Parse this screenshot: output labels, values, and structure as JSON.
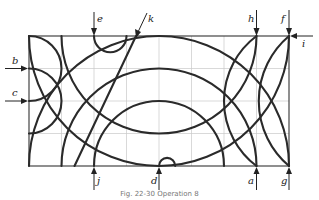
{
  "figure": {
    "caption": "Fig. 22-30  Operation 8",
    "grid": {
      "columns": 8,
      "rows": 4,
      "origin_px": [
        29,
        36
      ],
      "cell_px": 32.5
    },
    "colors": {
      "line": "#2a2a2a",
      "grid": "#c8c8c8",
      "background": "#ffffff"
    },
    "labels": {
      "a": "a",
      "b": "b",
      "c": "c",
      "d": "d",
      "e": "e",
      "f": "f",
      "g": "g",
      "h": "h",
      "i": "i",
      "j": "j",
      "k": "k"
    },
    "arrows": [
      {
        "id": "a",
        "side": "bottom",
        "grid_x": 7
      },
      {
        "id": "b",
        "side": "left",
        "grid_y": 1
      },
      {
        "id": "c",
        "side": "left",
        "grid_y": 2
      },
      {
        "id": "d",
        "side": "bottom",
        "grid_x": 4
      },
      {
        "id": "e",
        "side": "top",
        "grid_x": 2
      },
      {
        "id": "f",
        "side": "top",
        "grid_x": 8
      },
      {
        "id": "g",
        "side": "bottom",
        "grid_x": 8
      },
      {
        "id": "h",
        "side": "top",
        "grid_x": 7
      },
      {
        "id": "i",
        "side": "right",
        "grid_y": 0
      },
      {
        "id": "j",
        "side": "bottom",
        "grid_x": 2
      },
      {
        "id": "k",
        "side": "top-diagonal",
        "grid_x": 3.3
      }
    ],
    "curves": [
      {
        "name": "outer-arch",
        "type": "arc",
        "center": [
          4,
          4
        ],
        "radius": 4,
        "half": "upper"
      },
      {
        "name": "middle-arch",
        "type": "arc",
        "center": [
          4,
          4
        ],
        "radius": 3,
        "half": "upper"
      },
      {
        "name": "inner-arch",
        "type": "arc",
        "center": [
          4,
          4
        ],
        "radius": 2,
        "half": "upper"
      },
      {
        "name": "large-bowl",
        "type": "arc",
        "center": [
          4,
          0
        ],
        "radius": 4,
        "half": "lower"
      },
      {
        "name": "small-bowl",
        "type": "arc",
        "center": [
          4,
          0
        ],
        "radius": 3,
        "half": "lower"
      },
      {
        "name": "left-lobe-upper",
        "type": "arc",
        "center": [
          0,
          1
        ],
        "radius": 1,
        "half": "right"
      },
      {
        "name": "left-lobe-lower",
        "type": "arc",
        "center": [
          0,
          2
        ],
        "radius": 1,
        "half": "right"
      },
      {
        "name": "right-lens",
        "type": "arc",
        "through": [
          [
            7,
            0
          ],
          [
            6,
            2
          ],
          [
            7,
            4
          ]
        ]
      },
      {
        "name": "right-lens-outer",
        "type": "arc",
        "through": [
          [
            8,
            0
          ],
          [
            6.8,
            2
          ],
          [
            8,
            4
          ]
        ]
      },
      {
        "name": "e-notch",
        "type": "arc",
        "center": [
          2.5,
          0
        ],
        "radius": 0.5,
        "half": "lower"
      },
      {
        "name": "d-notch",
        "type": "arc",
        "center": [
          4.25,
          4
        ],
        "radius": 0.25,
        "half": "upper"
      },
      {
        "name": "k-line",
        "type": "line",
        "from": [
          3.3,
          0
        ],
        "to": [
          1.4,
          4
        ]
      }
    ]
  }
}
